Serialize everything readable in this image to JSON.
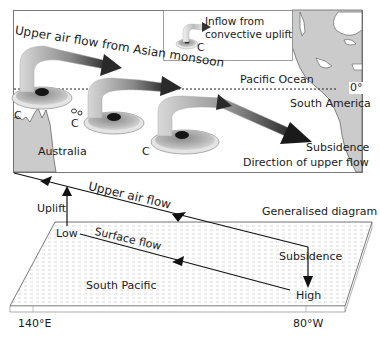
{
  "map": {
    "title_arrow": "Upper air flow from Asian monsoon",
    "legend": {
      "line1": "Inflow from",
      "line2": "convective uplift",
      "symbol": "C"
    },
    "ocean_label": "Pacific Ocean",
    "equator_label": "0°",
    "continent_right": "South America",
    "continent_left": "Australia",
    "subsidence": "Subsidence",
    "direction": "Direction of upper flow",
    "convection_markers": [
      "C",
      "C",
      "C"
    ]
  },
  "generalised": {
    "title": "Generalised diagram",
    "upper_flow": "Upper air flow",
    "uplift": "Uplift",
    "low": "Low",
    "surface_flow": "Surface flow",
    "subsidence": "Subsidence",
    "high": "High",
    "region": "South Pacific",
    "lon_left": "140°E",
    "lon_right": "80°W"
  },
  "colors": {
    "land": "#c9c9c9",
    "land_stroke": "#666666",
    "arrow_dark": "#222222",
    "arrow_light": "#b5b5b5",
    "dash_lines": "#c8c8c8"
  }
}
